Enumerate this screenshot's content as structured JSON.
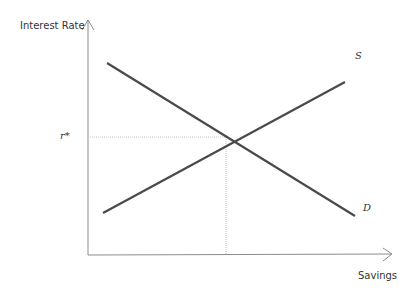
{
  "diagram": {
    "type": "supply-demand",
    "y_axis_label": "Interest Rate",
    "x_axis_label": "Savings",
    "equilibrium_label": "r*",
    "curves": [
      {
        "name": "S",
        "label": "S",
        "from": [
          103,
          213
        ],
        "to": [
          345,
          82
        ]
      },
      {
        "name": "D",
        "label": "D",
        "from": [
          107,
          63
        ],
        "to": [
          355,
          216
        ]
      }
    ],
    "equilibrium_point": [
      226,
      137
    ],
    "colors": {
      "curve": "#444444",
      "axis": "#888888",
      "guide": "#bbbbbb",
      "text": "#333333"
    }
  }
}
